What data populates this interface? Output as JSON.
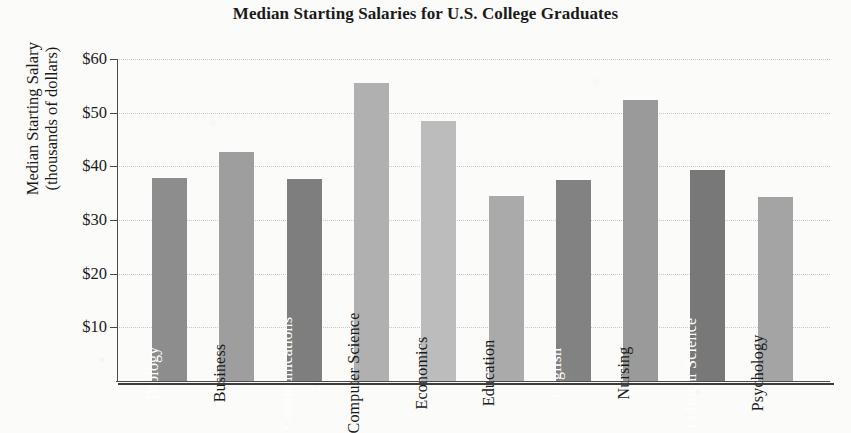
{
  "chart_data": {
    "type": "bar",
    "title": "Median Starting Salaries for U.S. College Graduates",
    "xlabel": "",
    "ylabel": "Median Starting Salary (thousands of dollars)",
    "ylabel_line1": "Median Starting Salary",
    "ylabel_line2": "(thousands of dollars)",
    "ylim": [
      0,
      60
    ],
    "grid": true,
    "legend": "none",
    "y_tick_labels": [
      "$60",
      "$50",
      "$40",
      "$30",
      "$20",
      "$10"
    ],
    "y_tick_values": [
      60,
      50,
      40,
      30,
      20,
      10
    ],
    "categories": [
      "Biology",
      "Business",
      "Communications",
      "Computer Science",
      "Economics",
      "Education",
      "English",
      "Nursing",
      "Political Science",
      "Psychology"
    ],
    "values": [
      37.8,
      42.7,
      37.6,
      55.6,
      48.4,
      34.5,
      37.4,
      52.4,
      39.4,
      34.3
    ],
    "bars": [
      {
        "category": "Biology",
        "value": 37.8,
        "color": "#8d8d8d",
        "label_color": "#ffffff"
      },
      {
        "category": "Business",
        "value": 42.7,
        "color": "#9e9e9e",
        "label_color": "#1a1a1a"
      },
      {
        "category": "Communications",
        "value": 37.6,
        "color": "#7e7e7e",
        "label_color": "#ffffff"
      },
      {
        "category": "Computer Science",
        "value": 55.6,
        "color": "#b0b0b0",
        "label_color": "#1a1a1a"
      },
      {
        "category": "Economics",
        "value": 48.4,
        "color": "#bcbcbc",
        "label_color": "#1a1a1a"
      },
      {
        "category": "Education",
        "value": 34.5,
        "color": "#aaaaaa",
        "label_color": "#1a1a1a"
      },
      {
        "category": "English",
        "value": 37.4,
        "color": "#828282",
        "label_color": "#ffffff"
      },
      {
        "category": "Nursing",
        "value": 52.4,
        "color": "#9a9a9a",
        "label_color": "#1a1a1a"
      },
      {
        "category": "Political Science",
        "value": 39.4,
        "color": "#787878",
        "label_color": "#ffffff"
      },
      {
        "category": "Psychology",
        "value": 34.3,
        "color": "#a4a4a4",
        "label_color": "#1a1a1a"
      }
    ]
  }
}
